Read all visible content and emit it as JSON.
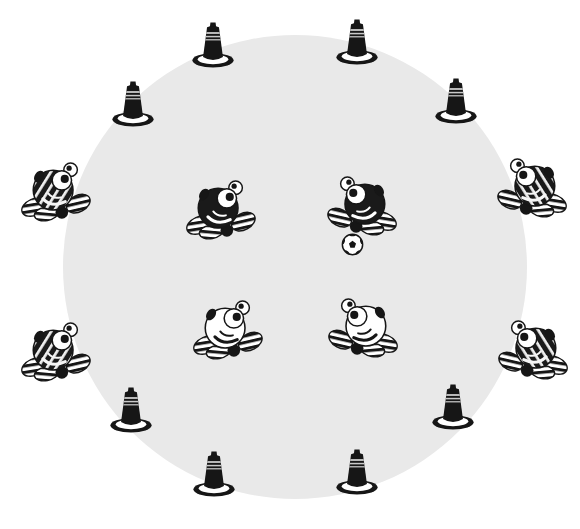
{
  "scene": {
    "description": "Grayscale illustration of a circular playing field: traffic cones spaced around the rim, four striped bug characters sitting on the edge, two dark bugs and two white bugs inside the circle facing each other, and a soccer ball beside the right dark bug.",
    "colors": {
      "background": "#ffffff",
      "field_fill": "#e9e9e9",
      "ink": "#161616",
      "cone_stripe": "#c9c9c9",
      "bug_dark_body": "#1a1a1a",
      "bug_white_body": "#ffffff"
    },
    "field": {
      "cx": 295,
      "cy": 267,
      "r": 232
    },
    "counts": {
      "cones": 8,
      "striped_bugs": 4,
      "dark_bugs": 2,
      "white_bugs": 2,
      "balls": 1
    },
    "items": [
      {
        "type": "cone",
        "name": "cone-top-left",
        "x": 213,
        "y": 45,
        "flip": false
      },
      {
        "type": "cone",
        "name": "cone-top-right",
        "x": 357,
        "y": 42,
        "flip": false
      },
      {
        "type": "cone",
        "name": "cone-upper-left",
        "x": 133,
        "y": 104,
        "flip": false
      },
      {
        "type": "cone",
        "name": "cone-upper-right",
        "x": 456,
        "y": 101,
        "flip": false
      },
      {
        "type": "cone",
        "name": "cone-lower-left",
        "x": 131,
        "y": 410,
        "flip": false
      },
      {
        "type": "cone",
        "name": "cone-lower-right",
        "x": 453,
        "y": 407,
        "flip": false
      },
      {
        "type": "cone",
        "name": "cone-bottom-left",
        "x": 214,
        "y": 474,
        "flip": false
      },
      {
        "type": "cone",
        "name": "cone-bottom-right",
        "x": 357,
        "y": 472,
        "flip": false
      },
      {
        "type": "bug-striped",
        "name": "striped-bug-left-upper",
        "x": 57,
        "y": 192,
        "flip": false
      },
      {
        "type": "bug-striped",
        "name": "striped-bug-right-upper",
        "x": 531,
        "y": 188,
        "flip": true
      },
      {
        "type": "bug-striped",
        "name": "striped-bug-left-lower",
        "x": 57,
        "y": 352,
        "flip": false
      },
      {
        "type": "bug-striped",
        "name": "striped-bug-right-lower",
        "x": 532,
        "y": 350,
        "flip": true
      },
      {
        "type": "bug-dark",
        "name": "dark-bug-left",
        "x": 222,
        "y": 210,
        "flip": false
      },
      {
        "type": "bug-dark",
        "name": "dark-bug-right",
        "x": 361,
        "y": 206,
        "flip": true
      },
      {
        "type": "bug-white",
        "name": "white-bug-left",
        "x": 229,
        "y": 330,
        "flip": false
      },
      {
        "type": "bug-white",
        "name": "white-bug-right",
        "x": 362,
        "y": 328,
        "flip": true
      },
      {
        "type": "soccer-ball",
        "name": "soccer-ball",
        "x": 352,
        "y": 244,
        "flip": false
      }
    ]
  }
}
